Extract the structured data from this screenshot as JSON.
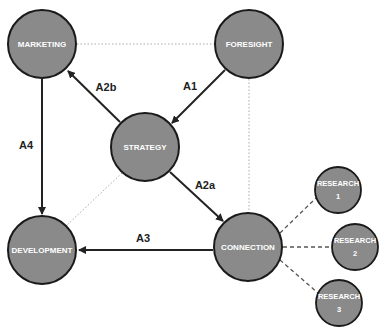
{
  "diagram": {
    "colors": {
      "node_fill": "#8a8a8a",
      "node_stroke": "#1a1a1a",
      "node_text": "#ffffff",
      "arrow": "#222222",
      "dotted_link": "#aaaaaa",
      "dashed_link": "#555555"
    },
    "nodes": {
      "marketing": {
        "label": "MARKETING"
      },
      "foresight": {
        "label": "FORESIGHT"
      },
      "strategy": {
        "label": "STRATEGY"
      },
      "development": {
        "label": "DEVELOPMENT"
      },
      "connection": {
        "label": "CONNECTION"
      },
      "research1": {
        "line1": "RESEARCH",
        "line2": "1"
      },
      "research2": {
        "line1": "RESEARCH",
        "line2": "2"
      },
      "research3": {
        "line1": "RESEARCH",
        "line2": "3"
      }
    },
    "edges": {
      "a1": {
        "label": "A1",
        "from": "FORESIGHT",
        "to": "STRATEGY",
        "style": "solid-arrow"
      },
      "a2a": {
        "label": "A2a",
        "from": "STRATEGY",
        "to": "CONNECTION",
        "style": "solid-arrow"
      },
      "a2b": {
        "label": "A2b",
        "from": "STRATEGY",
        "to": "MARKETING",
        "style": "solid-arrow"
      },
      "a3": {
        "label": "A3",
        "from": "CONNECTION",
        "to": "DEVELOPMENT",
        "style": "solid-arrow"
      },
      "a4": {
        "label": "A4",
        "from": "MARKETING",
        "to": "DEVELOPMENT",
        "style": "solid-arrow"
      }
    },
    "dotted_links": [
      {
        "from": "MARKETING",
        "to": "FORESIGHT"
      },
      {
        "from": "FORESIGHT",
        "to": "CONNECTION"
      },
      {
        "from": "STRATEGY",
        "to": "DEVELOPMENT"
      }
    ],
    "dashed_links": [
      {
        "from": "CONNECTION",
        "to": "RESEARCH 1"
      },
      {
        "from": "CONNECTION",
        "to": "RESEARCH 2"
      },
      {
        "from": "CONNECTION",
        "to": "RESEARCH 3"
      }
    ]
  }
}
